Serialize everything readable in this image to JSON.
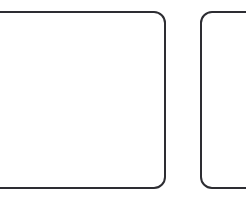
{
  "canvas": {
    "width": 246,
    "height": 204,
    "background_color": "#ffffff",
    "description": "Two white rounded-rectangle outlines on a white background, both clipped by the image frame"
  },
  "style": {
    "stroke_color": "#2d2d32",
    "stroke_width": 2,
    "fill_color": "#ffffff",
    "corner_radius": 11
  },
  "shapes": [
    {
      "id": "shape-left",
      "name": "rounded-rectangle-left",
      "label": "Left rounded rectangle",
      "x": -38,
      "y": 12,
      "width": 203,
      "height": 176,
      "rx": 11,
      "clipped_edges": "left",
      "stroke_color": "#2d2d32",
      "stroke_width": 2,
      "fill_color": "#ffffff"
    },
    {
      "id": "shape-right",
      "name": "rounded-rectangle-right",
      "label": "Right rounded rectangle",
      "x": 201,
      "y": 12,
      "width": 90,
      "height": 176,
      "rx": 11,
      "clipped_edges": "right",
      "stroke_color": "#2d2d32",
      "stroke_width": 2,
      "fill_color": "#ffffff"
    }
  ],
  "gap": {
    "label": "Gap between shapes",
    "x": 166,
    "width": 35
  }
}
